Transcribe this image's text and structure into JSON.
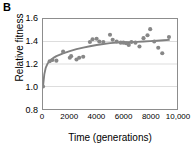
{
  "panel": {
    "label": "B"
  },
  "chart_data": {
    "type": "scatter",
    "title": "",
    "subtitle": "",
    "xlabel": "Time (generations)",
    "ylabel": "Relative fitness",
    "xlim": [
      0,
      10000
    ],
    "ylim": [
      0.8,
      1.6
    ],
    "xticks": [
      0,
      2000,
      4000,
      6000,
      8000,
      10000
    ],
    "xtick_labels": [
      "0",
      "2000",
      "4000",
      "6000",
      "8000",
      "10,000"
    ],
    "yticks": [
      0.8,
      1.0,
      1.2,
      1.4,
      1.6
    ],
    "ytick_labels": [
      "0.8",
      "1.0",
      "1.2",
      "1.4",
      "1.6"
    ],
    "grid": "horizontal",
    "legend": "none",
    "marker_color": "#878787",
    "line_color": "#808080",
    "axis_color": "#8d8d8d",
    "grid_color": "#d4d4d4",
    "series": [
      {
        "name": "Relative fitness (observed)",
        "type": "scatter",
        "points": [
          [
            0,
            1.0
          ],
          [
            500,
            1.225
          ],
          [
            700,
            1.235
          ],
          [
            1000,
            1.23
          ],
          [
            1500,
            1.31
          ],
          [
            2000,
            1.255
          ],
          [
            2100,
            1.27
          ],
          [
            2500,
            1.24
          ],
          [
            2700,
            1.255
          ],
          [
            3000,
            1.265
          ],
          [
            3500,
            1.395
          ],
          [
            3700,
            1.42
          ],
          [
            4000,
            1.425
          ],
          [
            4200,
            1.4
          ],
          [
            4500,
            1.395
          ],
          [
            5000,
            1.46
          ],
          [
            5200,
            1.415
          ],
          [
            5500,
            1.4
          ],
          [
            5800,
            1.39
          ],
          [
            6000,
            1.39
          ],
          [
            6200,
            1.385
          ],
          [
            6400,
            1.37
          ],
          [
            6600,
            1.395
          ],
          [
            6900,
            1.39
          ],
          [
            7200,
            1.355
          ],
          [
            7500,
            1.43
          ],
          [
            7800,
            1.455
          ],
          [
            8000,
            1.51
          ],
          [
            8300,
            1.4
          ],
          [
            8600,
            1.345
          ],
          [
            8900,
            1.295
          ],
          [
            9400,
            1.44
          ]
        ]
      },
      {
        "name": "Hyperbolic fit",
        "type": "line",
        "points": [
          [
            0,
            1.0
          ],
          [
            100,
            1.11
          ],
          [
            200,
            1.165
          ],
          [
            350,
            1.205
          ],
          [
            500,
            1.228
          ],
          [
            750,
            1.252
          ],
          [
            1000,
            1.27
          ],
          [
            1500,
            1.295
          ],
          [
            2000,
            1.315
          ],
          [
            2500,
            1.332
          ],
          [
            3000,
            1.346
          ],
          [
            3500,
            1.358
          ],
          [
            4000,
            1.369
          ],
          [
            4500,
            1.378
          ],
          [
            5000,
            1.385
          ],
          [
            5500,
            1.39
          ],
          [
            6000,
            1.393
          ],
          [
            6500,
            1.395
          ],
          [
            7000,
            1.397
          ],
          [
            7500,
            1.4
          ],
          [
            8000,
            1.403
          ],
          [
            8500,
            1.407
          ],
          [
            9000,
            1.411
          ],
          [
            9400,
            1.414
          ]
        ]
      }
    ]
  }
}
